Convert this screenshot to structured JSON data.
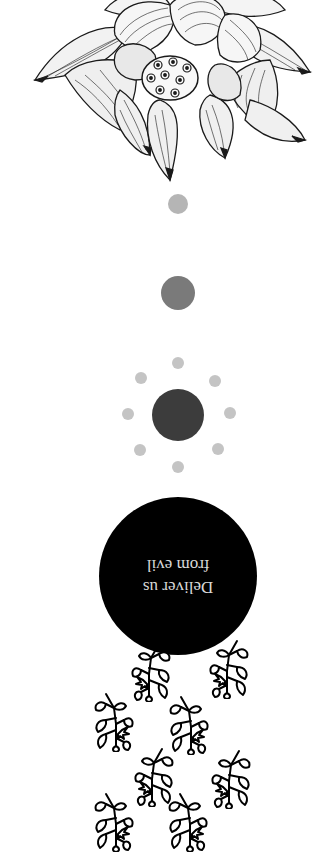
{
  "illustration": {
    "flower": "lotus-flower-line-drawing",
    "vine": "leaf-sprig"
  },
  "quote": {
    "line1": "Deliver us",
    "line2": "from evil",
    "orientation_deg": 180
  },
  "colors": {
    "background": "#ffffff",
    "small_circle": "#b5b5b5",
    "medium_circle": "#7a7a7a",
    "large_circle": "#3c3c3c",
    "ring_dots": "#c4c4c4",
    "quote_circle": "#000000",
    "quote_text": "#d9d9d9"
  },
  "sprigs": [
    {
      "x": 129,
      "y": 640,
      "flip": false
    },
    {
      "x": 207,
      "y": 637,
      "flip": false
    },
    {
      "x": 90,
      "y": 690,
      "flip": true
    },
    {
      "x": 165,
      "y": 693,
      "flip": true
    },
    {
      "x": 132,
      "y": 745,
      "flip": false
    },
    {
      "x": 209,
      "y": 747,
      "flip": false
    },
    {
      "x": 90,
      "y": 790,
      "flip": true
    },
    {
      "x": 164,
      "y": 790,
      "flip": true
    }
  ]
}
